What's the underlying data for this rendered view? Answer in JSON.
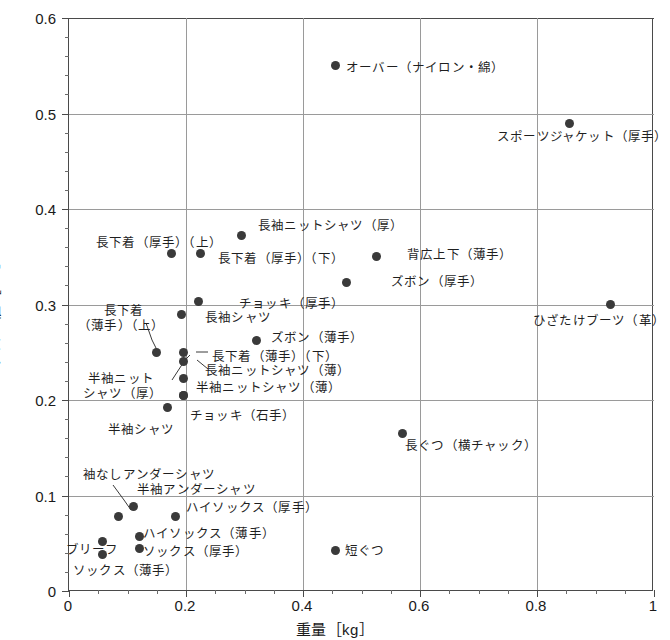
{
  "chart_data": {
    "type": "scatter",
    "title": "",
    "xlabel": "重量［kg］",
    "ylabel": "クロー値［clo］",
    "xlim": [
      0,
      1
    ],
    "ylim": [
      0,
      0.6
    ],
    "xticks": [
      "0",
      "0.2",
      "0.4",
      "0.6",
      "0.8",
      "1"
    ],
    "xtick_values": [
      0,
      0.2,
      0.4,
      0.6,
      0.8,
      1
    ],
    "yticks": [
      "0",
      "0.1",
      "0.2",
      "0.3",
      "0.4",
      "0.5",
      "0.6"
    ],
    "ytick_values": [
      0,
      0.1,
      0.2,
      0.3,
      0.4,
      0.5,
      0.6
    ],
    "grid": true,
    "legend": "none",
    "marker": "filled-circle",
    "marker_color": "#3a3a3a",
    "points": [
      {
        "label": "オーバー（ナイロン・綿）",
        "x": 0.455,
        "y": 0.55
      },
      {
        "label": "スポーツジャケット（厚手）",
        "x": 0.855,
        "y": 0.49
      },
      {
        "label": "長袖ニットシャツ（厚）",
        "x": 0.295,
        "y": 0.372
      },
      {
        "label": "長下着（厚手）（上）",
        "x": 0.175,
        "y": 0.353
      },
      {
        "label": "長下着（厚手）（下）",
        "x": 0.225,
        "y": 0.353
      },
      {
        "label": "背広上下（薄手）",
        "x": 0.525,
        "y": 0.35
      },
      {
        "label": "ズボン（厚手）",
        "x": 0.475,
        "y": 0.323
      },
      {
        "label": "ひざたけブーツ（革）",
        "x": 0.925,
        "y": 0.3
      },
      {
        "label": "チョッキ（厚手）",
        "x": 0.222,
        "y": 0.303
      },
      {
        "label": "長袖シャツ",
        "x": 0.192,
        "y": 0.29
      },
      {
        "label": "ズボン（薄手）",
        "x": 0.32,
        "y": 0.262
      },
      {
        "label": "長下着（薄手）（上）",
        "x": 0.15,
        "y": 0.25
      },
      {
        "label": "長下着（薄手）（下）",
        "x": 0.196,
        "y": 0.25
      },
      {
        "label": "長袖ニットシャツ（薄）",
        "x": 0.196,
        "y": 0.24
      },
      {
        "label": "半袖ニットシャツ（厚）",
        "x": 0.196,
        "y": 0.222
      },
      {
        "label": "半袖ニットシャツ（薄）",
        "x": 0.196,
        "y": 0.205
      },
      {
        "label": "チョッキ（石手）",
        "x": 0.196,
        "y": 0.205
      },
      {
        "label": "半袖シャツ",
        "x": 0.168,
        "y": 0.192
      },
      {
        "label": "長ぐつ（横チャック）",
        "x": 0.57,
        "y": 0.165
      },
      {
        "label": "半袖アンダーシャツ",
        "x": 0.11,
        "y": 0.088
      },
      {
        "label": "袖なしアンダーシャツ",
        "x": 0.085,
        "y": 0.078
      },
      {
        "label": "ハイソックス（厚手）",
        "x": 0.182,
        "y": 0.078
      },
      {
        "label": "ハイソックス（薄手）",
        "x": 0.12,
        "y": 0.057
      },
      {
        "label": "ブリーフ",
        "x": 0.058,
        "y": 0.052
      },
      {
        "label": "ソックス（厚手）",
        "x": 0.12,
        "y": 0.045
      },
      {
        "label": "ソックス（薄手）",
        "x": 0.058,
        "y": 0.038
      },
      {
        "label": "短ぐつ",
        "x": 0.455,
        "y": 0.042
      }
    ]
  },
  "axis": {
    "x_title": "重量［kg］",
    "y_title": "クロー値［clo］",
    "x_ticks": [
      "0",
      "0.2",
      "0.4",
      "0.6",
      "0.8",
      "1"
    ],
    "y_ticks": [
      "0.6",
      "0.5",
      "0.4",
      "0.3",
      "0.2",
      "0.1",
      "0"
    ]
  },
  "labels": {
    "over_nylon_cotton": "オーバー（ナイロン・綿）",
    "sports_jacket_thick": "スポーツジャケット（厚手）",
    "long_sleeve_knit_thick": "長袖ニットシャツ（厚）",
    "nagashitagi_thick_upper": "長下着（厚手）（上）",
    "nagashitagi_thick_lower": "長下着（厚手）（下）",
    "suit_thin": "背広上下（薄手）",
    "trousers_thick": "ズボン（厚手）",
    "knee_boots_leather": "ひざたけブーツ（革）",
    "vest_thick": "チョッキ（厚手）",
    "long_sleeve_shirt": "長袖シャツ",
    "trousers_thin": "ズボン（薄手）",
    "nagashitagi_thin_upper_1": "長下着",
    "nagashitagi_thin_upper_2": "（薄手）（上）",
    "nagashitagi_thin_lower": "長下着（薄手）（下）",
    "long_sleeve_knit_thin": "長袖ニットシャツ（薄）",
    "half_sleeve_knit_thick_1": "半袖ニット",
    "half_sleeve_knit_thick_2": "シャツ（厚）",
    "half_sleeve_knit_thin": "半袖ニットシャツ（薄）",
    "vest_stone": "チョッキ（石手）",
    "half_sleeve_shirt": "半袖シャツ",
    "long_boots_side_zip": "長ぐつ（横チャック）",
    "sleeveless_undershirt": "袖なしアンダーシャツ",
    "half_sleeve_undershirt": "半袖アンダーシャツ",
    "high_socks_thick": "ハイソックス（厚手）",
    "high_socks_thin": "ハイソックス（薄手）",
    "briefs": "ブリーフ",
    "socks_thick": "ソックス（厚手）",
    "socks_thin": "ソックス（薄手）",
    "short_boots": "短ぐつ"
  }
}
